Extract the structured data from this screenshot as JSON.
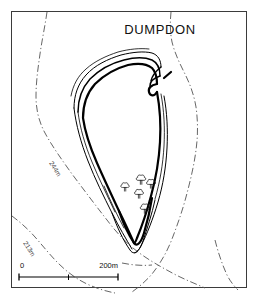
{
  "figure": {
    "title": "DUMPDON",
    "kind": "archaeological-site-plan",
    "width": 258,
    "height": 294,
    "background_color": "#ffffff",
    "frame_color": "#3b3b3b",
    "ink_color": "#000000",
    "contour_color": "#555555"
  },
  "scale_bar": {
    "start_label": "0",
    "end_label": "200m",
    "midpoint_label": "",
    "divisions": 2
  },
  "contours": [
    {
      "label": "244m",
      "role": "inner-contour"
    },
    {
      "label": "213m",
      "role": "outer-contour"
    }
  ],
  "map_features": {
    "enclosure_name": "Dumpdon Camp",
    "entrance_label": "",
    "rampart_count": 4,
    "tree_symbol_count": 5,
    "tree_symbol_name": "deciduous-tree-symbol"
  },
  "icons": {
    "tree": "tree-icon",
    "contour": "contour-line-icon",
    "scalebar": "scale-bar-icon"
  }
}
